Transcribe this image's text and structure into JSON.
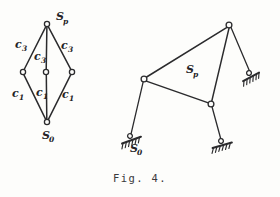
{
  "figure": {
    "caption": "Fig. 4.",
    "ink_color": "#2b2b2d",
    "paper_color": "#fdfdfb"
  },
  "graph_diagram": {
    "name": "kinematic-graph-rhombus",
    "nodes": [
      {
        "id": "sp",
        "label": "S",
        "sub": "p",
        "x": 47,
        "y": 24,
        "label_x": 56,
        "label_y": 20,
        "sub_x": 63,
        "sub_y": 24
      },
      {
        "id": "m_left",
        "label": "",
        "sub": "",
        "x": 23,
        "y": 72
      },
      {
        "id": "m_center",
        "label": "",
        "sub": "",
        "x": 46,
        "y": 72
      },
      {
        "id": "m_right",
        "label": "",
        "sub": "",
        "x": 72,
        "y": 72
      },
      {
        "id": "s0",
        "label": "S",
        "sub": "0",
        "x": 47,
        "y": 122,
        "label_x": 42,
        "label_y": 139,
        "sub_x": 49,
        "sub_y": 142
      }
    ],
    "edge_labels": [
      {
        "id": "c3-left",
        "label": "c",
        "sub": "3",
        "x": 15,
        "y": 48,
        "sub_x": 22,
        "sub_y": 51
      },
      {
        "id": "c3-center",
        "label": "c",
        "sub": "3",
        "x": 34,
        "y": 60,
        "sub_x": 41,
        "sub_y": 63
      },
      {
        "id": "c3-right",
        "label": "c",
        "sub": "3",
        "x": 61,
        "y": 49,
        "sub_x": 68,
        "sub_y": 52
      },
      {
        "id": "c1-left",
        "label": "c",
        "sub": "1",
        "x": 12,
        "y": 97,
        "sub_x": 19,
        "sub_y": 100
      },
      {
        "id": "c1-center",
        "label": "c",
        "sub": "1",
        "x": 36,
        "y": 96,
        "sub_x": 43,
        "sub_y": 99
      },
      {
        "id": "c1-right",
        "label": "c",
        "sub": "1",
        "x": 62,
        "y": 98,
        "sub_x": 69,
        "sub_y": 101
      }
    ]
  },
  "mechanism_diagram": {
    "name": "linkage-mechanism",
    "coupler_label": {
      "label": "S",
      "sub": "p",
      "x": 186,
      "y": 73,
      "sub_x": 193,
      "sub_y": 77
    },
    "ground_label": {
      "label": "S",
      "sub": "0",
      "x": 130,
      "y": 152,
      "sub_x": 137,
      "sub_y": 155
    },
    "joints": [
      {
        "id": "apex",
        "x": 229,
        "y": 25
      },
      {
        "id": "left",
        "x": 144,
        "y": 79
      },
      {
        "id": "lower-right",
        "x": 211,
        "y": 104
      }
    ],
    "ground_supports": [
      {
        "id": "ground-right-upper",
        "x": 249,
        "y": 73,
        "angle": -28
      },
      {
        "id": "ground-left-lower",
        "x": 130,
        "y": 136,
        "angle": -20
      },
      {
        "id": "ground-right-lower",
        "x": 221,
        "y": 141,
        "angle": -16
      }
    ]
  }
}
